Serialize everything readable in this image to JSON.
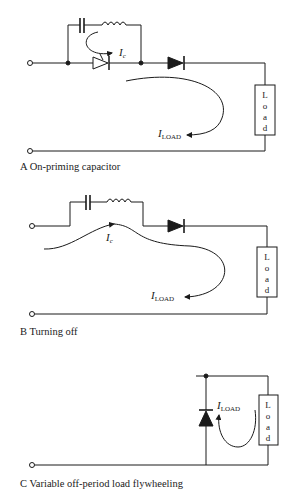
{
  "panels": [
    {
      "id": "A",
      "caption": "A  On-priming capacitor",
      "labels": {
        "ic_main": "I",
        "ic_sub": "c",
        "iload_main": "I",
        "iload_sub": "LOAD",
        "load": [
          "L",
          "o",
          "a",
          "d"
        ]
      }
    },
    {
      "id": "B",
      "caption": "B  Turning off",
      "labels": {
        "ic_main": "I",
        "ic_sub": "c",
        "iload_main": "I",
        "iload_sub": "LOAD",
        "load": [
          "L",
          "o",
          "a",
          "d"
        ]
      }
    },
    {
      "id": "C",
      "caption": "C  Variable off-period load flywheeling",
      "labels": {
        "iload_main": "I",
        "iload_sub": "LOAD",
        "load": [
          "L",
          "o",
          "a",
          "d"
        ]
      }
    }
  ],
  "colors": {
    "ink": "#1a1a1a",
    "background": "#ffffff"
  }
}
